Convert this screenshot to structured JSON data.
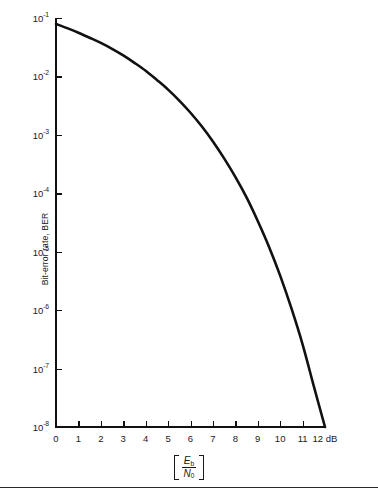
{
  "chart_data": {
    "type": "line",
    "title": "",
    "xlabel": "[Eb/N0]",
    "ylabel": "Bit-error rate, BER",
    "yscale": "log",
    "xscale": "linear",
    "xlim": [
      0,
      12
    ],
    "ylim": [
      1e-08,
      0.1
    ],
    "xunit": "dB",
    "grid": false,
    "legend": null,
    "series": [
      {
        "name": "Bit-error rate, BER",
        "x": [
          0,
          0.5,
          1,
          1.5,
          2,
          2.5,
          3,
          3.5,
          4,
          4.5,
          5,
          5.5,
          6,
          6.5,
          7,
          7.5,
          8,
          8.5,
          9,
          9.5,
          10,
          10.5,
          11,
          11.5,
          12
        ],
        "y": [
          0.079,
          0.067,
          0.056,
          0.046,
          0.0375,
          0.0297,
          0.0229,
          0.0171,
          0.0125,
          0.0087,
          0.00595,
          0.00386,
          0.00239,
          0.0014,
          0.00077,
          0.000396,
          0.000191,
          8.5e-05,
          3.36e-05,
          1.22e-05,
          3.9e-06,
          1.08e-06,
          2.6e-07,
          5e-08,
          1e-08
        ]
      }
    ]
  },
  "axes": {
    "y_ticks": [
      {
        "label_mantissa": "10",
        "label_exponent": "-1",
        "value": 0.1
      },
      {
        "label_mantissa": "10",
        "label_exponent": "-2",
        "value": 0.01
      },
      {
        "label_mantissa": "10",
        "label_exponent": "-3",
        "value": 0.001
      },
      {
        "label_mantissa": "10",
        "label_exponent": "-4",
        "value": 0.0001
      },
      {
        "label_mantissa": "10",
        "label_exponent": "-5",
        "value": 1e-05
      },
      {
        "label_mantissa": "10",
        "label_exponent": "-6",
        "value": 1e-06
      },
      {
        "label_mantissa": "10",
        "label_exponent": "-7",
        "value": 1e-07
      },
      {
        "label_mantissa": "10",
        "label_exponent": "-8",
        "value": 1e-08
      }
    ],
    "x_ticks": [
      {
        "label": "0",
        "value": 0
      },
      {
        "label": "1",
        "value": 1
      },
      {
        "label": "2",
        "value": 2
      },
      {
        "label": "3",
        "value": 3
      },
      {
        "label": "4",
        "value": 4
      },
      {
        "label": "5",
        "value": 5
      },
      {
        "label": "6",
        "value": 6
      },
      {
        "label": "7",
        "value": 7
      },
      {
        "label": "8",
        "value": 8
      },
      {
        "label": "9",
        "value": 9
      },
      {
        "label": "10",
        "value": 10
      },
      {
        "label": "11",
        "value": 11
      },
      {
        "label": "12 dB",
        "value": 12
      }
    ],
    "y_title": "Bit-error rate, BER",
    "x_title": {
      "numerator": "E",
      "numerator_sub": "b",
      "denominator": "N",
      "denominator_sub": "0"
    }
  },
  "colors": {
    "curve": "#111111",
    "axis": "#111111",
    "text": "#1a1a1a",
    "background": "#ffffff",
    "footer_rule": "#2a2a2a"
  }
}
